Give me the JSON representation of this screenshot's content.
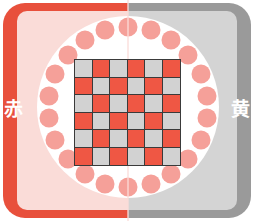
{
  "labels": {
    "left": "赤",
    "right": "黄"
  },
  "colors": {
    "left_panel_border": "#e8503c",
    "left_panel_fill": "#fadcd8",
    "right_panel_border": "#9a9a9a",
    "right_panel_fill": "#d4d4d4",
    "circle": "#ffffff",
    "ring_dot": "#f5a099",
    "cell_red": "#ef5744",
    "cell_gray": "#d2d2d2",
    "grid_line": "#3a3a3a"
  },
  "ring": {
    "dot_count": 22,
    "dot_radius_px": 9.5,
    "ring_radius_px": 80
  },
  "chart_data": {
    "type": "heatmap",
    "title": "",
    "xlabel": "",
    "ylabel": "",
    "rows": 6,
    "cols": 6,
    "legend": [
      "red",
      "gray"
    ],
    "grid": [
      [
        "gray",
        "red",
        "gray",
        "red",
        "gray",
        "red"
      ],
      [
        "red",
        "gray",
        "red",
        "gray",
        "red",
        "gray"
      ],
      [
        "gray",
        "red",
        "gray",
        "red",
        "gray",
        "red"
      ],
      [
        "red",
        "gray",
        "red",
        "gray",
        "red",
        "gray"
      ],
      [
        "gray",
        "red",
        "gray",
        "red",
        "gray",
        "red"
      ],
      [
        "red",
        "gray",
        "red",
        "gray",
        "red",
        "gray"
      ]
    ]
  }
}
